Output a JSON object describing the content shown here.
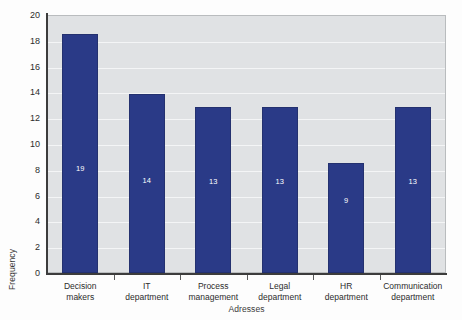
{
  "chart_data": {
    "type": "bar",
    "title": "",
    "categories": [
      "Decision makers",
      "IT department",
      "Process management",
      "Legal department",
      "HR department",
      "Communication department"
    ],
    "category_lines": [
      [
        "Decision",
        "makers"
      ],
      [
        "IT",
        "department"
      ],
      [
        "Process",
        "management"
      ],
      [
        "Legal",
        "department"
      ],
      [
        "HR",
        "department"
      ],
      [
        "Communication",
        "department"
      ]
    ],
    "values": [
      19,
      14,
      13,
      13,
      9,
      13
    ],
    "bar_heights": [
      18.5,
      13.9,
      12.88,
      12.88,
      8.55,
      12.85
    ],
    "data_labels": [
      "19",
      "14",
      "13",
      "13",
      "9",
      "13"
    ],
    "xlabel": "Adresses",
    "ylabel": "Frequency",
    "ylim": [
      0,
      20
    ],
    "ytick_values": [
      0,
      2,
      4,
      6,
      8,
      10,
      12,
      14,
      16,
      18,
      20
    ],
    "ytick_labels": [
      "0",
      "2",
      "4",
      "6",
      "8",
      "10",
      "12",
      "14",
      "16",
      "18",
      "20"
    ],
    "grid": "horizontal",
    "legend": "none",
    "colors": {
      "bar": "#2a3a87",
      "bar_edge": "#24316f",
      "plot_background": "#e0e2e4",
      "gridline": "#f4f5f6",
      "axis": "#3c3c3c",
      "data_label": "#ffffff",
      "text": "#2c2c2c",
      "figure_background": "#fdfdfd"
    }
  }
}
